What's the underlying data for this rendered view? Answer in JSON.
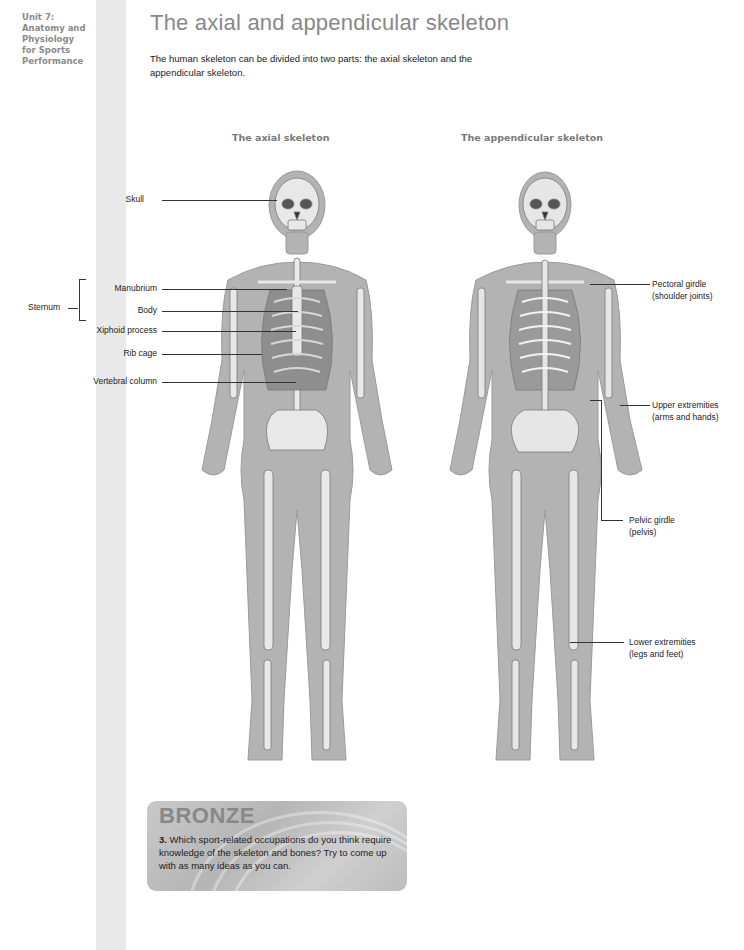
{
  "sidebar": {
    "unit_lines": [
      "Unit 7:",
      "Anatomy and",
      "Physiology",
      "for Sports",
      "Performance"
    ]
  },
  "page": {
    "title": "The axial and appendicular skeleton",
    "intro": "The human skeleton can be divided into two parts: the axial skeleton and the appendicular skeleton."
  },
  "figures": {
    "axial": {
      "title": "The axial skeleton",
      "labels": {
        "skull": "Skull",
        "sternum": "Sternum",
        "manubrium": "Manubrium",
        "body": "Body",
        "xiphoid": "Xiphoid process",
        "rib_cage": "Rib cage",
        "vertebral_column": "Vertebral column"
      }
    },
    "appendicular": {
      "title": "The appendicular skeleton",
      "labels": {
        "pectoral_1": "Pectoral girdle",
        "pectoral_2": "(shoulder joints)",
        "upper_1": "Upper extremities",
        "upper_2": "(arms and hands)",
        "pelvic_1": "Pelvic girdle",
        "pelvic_2": "(pelvis)",
        "lower_1": "Lower extremities",
        "lower_2": "(legs and feet)"
      }
    }
  },
  "bronze": {
    "heading": "BRONZE",
    "number": "3.",
    "question": "Which sport-related occupations do you think require knowledge of the skeleton and bones? Try to come up with as many ideas as you can."
  }
}
